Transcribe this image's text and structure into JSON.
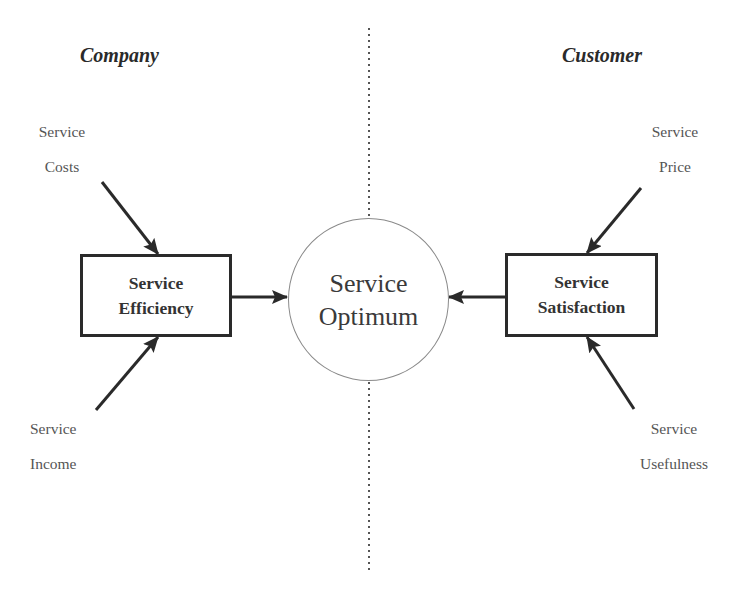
{
  "diagram": {
    "sides": {
      "left": {
        "heading": "Company"
      },
      "right": {
        "heading": "Customer"
      }
    },
    "center": {
      "line1": "Service",
      "line2": "Optimum"
    },
    "boxes": {
      "left": {
        "line1": "Service",
        "line2": "Efficiency"
      },
      "right": {
        "line1": "Service",
        "line2": "Satisfaction"
      }
    },
    "inputs": {
      "top_left": {
        "line1": "Service",
        "line2": "Costs"
      },
      "bottom_left": {
        "line1": "Service",
        "line2": "Income"
      },
      "top_right": {
        "line1": "Service",
        "line2": "Price"
      },
      "bottom_right": {
        "line1": "Service",
        "line2": "Usefulness"
      }
    },
    "colors": {
      "stroke": "#2a2a2a",
      "circle_stroke": "#8a8a8a",
      "divider": "#555555",
      "text": "#333333",
      "label_text": "#555555"
    }
  }
}
